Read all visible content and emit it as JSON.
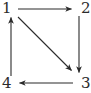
{
  "figure": {
    "kind": "directed-graph-diagram",
    "width": 91,
    "height": 93,
    "background_color": "#ffffff",
    "line_color": "#2b2b2b",
    "label_color": "#2b2b2b"
  },
  "nodes": [
    {
      "id": "1",
      "label": "1",
      "position": "top-left",
      "x": 11,
      "y": 9
    },
    {
      "id": "2",
      "label": "2",
      "position": "top-right",
      "x": 79,
      "y": 9
    },
    {
      "id": "3",
      "label": "3",
      "position": "bottom-right",
      "x": 79,
      "y": 83
    },
    {
      "id": "4",
      "label": "4",
      "position": "bottom-left",
      "x": 11,
      "y": 83
    }
  ],
  "edges": [
    {
      "id": "e1",
      "from": "1",
      "to": "2",
      "directed": true,
      "style": "horizontal-top",
      "x1": 18,
      "y1": 9,
      "x2": 73,
      "y2": 9
    },
    {
      "id": "e2",
      "from": "2",
      "to": "3",
      "directed": true,
      "style": "vertical-right",
      "x1": 79,
      "y1": 16,
      "x2": 79,
      "y2": 74
    },
    {
      "id": "e3",
      "from": "3",
      "to": "4",
      "directed": true,
      "style": "horizontal-bottom",
      "x1": 73,
      "y1": 83,
      "x2": 18,
      "y2": 83
    },
    {
      "id": "e4",
      "from": "4",
      "to": "1",
      "directed": true,
      "style": "vertical-left",
      "x1": 11,
      "y1": 76,
      "x2": 11,
      "y2": 16
    },
    {
      "id": "e5",
      "from": "1",
      "to": "3",
      "directed": true,
      "style": "diagonal",
      "x1": 18,
      "y1": 17,
      "x2": 73,
      "y2": 72
    }
  ]
}
